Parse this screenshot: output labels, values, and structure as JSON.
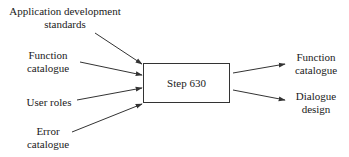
{
  "diagram": {
    "process": {
      "label": "Step 630"
    },
    "inputs": [
      {
        "line1": "Application development",
        "line2": "standards"
      },
      {
        "line1": "Function",
        "line2": "catalogue"
      },
      {
        "line1": "User roles"
      },
      {
        "line1": "Error",
        "line2": "catalogue"
      }
    ],
    "outputs": [
      {
        "line1": "Function",
        "line2": "catalogue"
      },
      {
        "line1": "Dialogue",
        "line2": "design"
      }
    ],
    "colors": {
      "line": "#333333",
      "text": "#1a1a1a",
      "background": "#ffffff"
    }
  }
}
